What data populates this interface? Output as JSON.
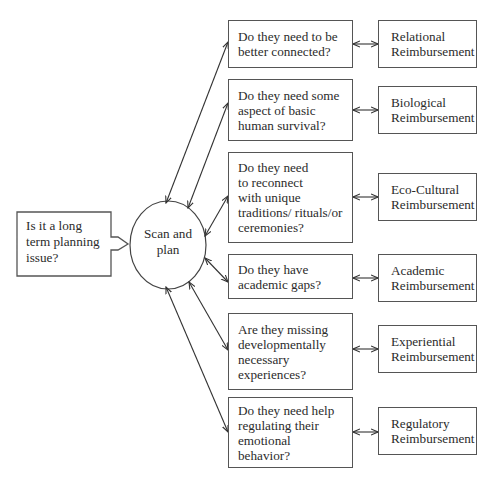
{
  "start": {
    "label": "Is it a long\nterm planning\nissue?"
  },
  "hub": {
    "label": "Scan and\nplan"
  },
  "questions": [
    {
      "label": "Do they need to be\nbetter connected?"
    },
    {
      "label": "Do they need some\naspect of basic\nhuman survival?"
    },
    {
      "label": "Do they need\nto reconnect\nwith unique\ntraditions/ rituals/or\nceremonies?"
    },
    {
      "label": "Do they have\nacademic gaps?"
    },
    {
      "label": "Are they missing\ndevelopmentally\nnecessary\nexperiences?"
    },
    {
      "label": "Do they need help\nregulating their\nemotional behavior?"
    }
  ],
  "outcomes": [
    {
      "label": "Relational\nReimbursement"
    },
    {
      "label": "Biological\nReimbursement"
    },
    {
      "label": "Eco-Cultural\nReimbursement"
    },
    {
      "label": "Academic\nReimbursement"
    },
    {
      "label": "Experiential\nReimbursement"
    },
    {
      "label": "Regulatory\nReimbursement"
    }
  ],
  "colors": {
    "line": "#333333",
    "border": "#555555"
  }
}
